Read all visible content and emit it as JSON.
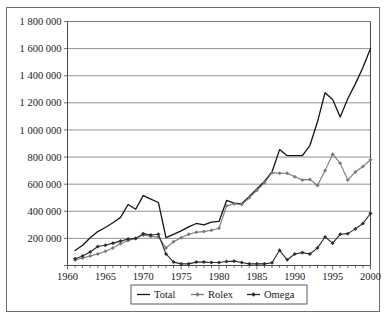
{
  "chart_data": {
    "type": "line",
    "title": "",
    "subtitle": "",
    "xlabel": "",
    "ylabel": "",
    "xlim": [
      1960,
      2000
    ],
    "ylim": [
      0,
      1800000
    ],
    "grid": true,
    "legend_position": "bottom",
    "y_ticks": [
      0,
      200000,
      400000,
      600000,
      800000,
      1000000,
      1200000,
      1400000,
      1600000,
      1800000
    ],
    "y_tick_labels": [
      "",
      "200 000",
      "400 000",
      "600 000",
      "800 000",
      "1 000 000",
      "1 200 000",
      "1 400 000",
      "1 600 000",
      "1 800 000"
    ],
    "x_ticks": [
      1960,
      1965,
      1970,
      1975,
      1980,
      1985,
      1990,
      1995,
      2000
    ],
    "x_tick_labels": [
      "1960",
      "1965",
      "1970",
      "1975",
      "1980",
      "1985",
      "1990",
      "1995",
      "2000"
    ],
    "x_minor_tick_interval": 1,
    "x": [
      1961,
      1962,
      1963,
      1964,
      1965,
      1966,
      1967,
      1968,
      1969,
      1970,
      1971,
      1972,
      1973,
      1974,
      1975,
      1976,
      1977,
      1978,
      1979,
      1980,
      1981,
      1982,
      1983,
      1984,
      1985,
      1986,
      1987,
      1988,
      1989,
      1990,
      1991,
      1992,
      1993,
      1994,
      1995,
      1996,
      1997,
      1998,
      1999,
      2000
    ],
    "series": [
      {
        "name": "Total",
        "color": "#141414",
        "marker": "none",
        "line_width": 1.3,
        "values": [
          110000,
          150000,
          205000,
          250000,
          280000,
          315000,
          355000,
          450000,
          415000,
          515000,
          490000,
          465000,
          205000,
          230000,
          255000,
          285000,
          310000,
          300000,
          320000,
          325000,
          480000,
          460000,
          455000,
          510000,
          565000,
          620000,
          690000,
          855000,
          810000,
          810000,
          810000,
          885000,
          1060000,
          1275000,
          1225000,
          1095000,
          1230000,
          1340000,
          1460000,
          1600000
        ]
      },
      {
        "name": "Rolex",
        "color": "#787878",
        "marker": "diamond",
        "line_width": 1.1,
        "values": [
          40000,
          55000,
          70000,
          85000,
          105000,
          130000,
          160000,
          185000,
          200000,
          225000,
          215000,
          210000,
          130000,
          175000,
          205000,
          230000,
          245000,
          250000,
          260000,
          275000,
          440000,
          455000,
          450000,
          500000,
          555000,
          610000,
          685000,
          680000,
          680000,
          655000,
          630000,
          635000,
          590000,
          700000,
          820000,
          755000,
          630000,
          690000,
          730000,
          780000
        ]
      },
      {
        "name": "Omega",
        "color": "#2b2b2b",
        "marker": "diamond",
        "line_width": 1.1,
        "values": [
          50000,
          70000,
          100000,
          140000,
          150000,
          165000,
          180000,
          195000,
          200000,
          235000,
          225000,
          230000,
          85000,
          25000,
          12000,
          12000,
          25000,
          25000,
          22000,
          22000,
          30000,
          32000,
          22000,
          12000,
          12000,
          12000,
          20000,
          112000,
          42000,
          85000,
          95000,
          85000,
          130000,
          210000,
          165000,
          230000,
          235000,
          270000,
          310000,
          385000
        ]
      }
    ]
  },
  "legend": {
    "items": [
      {
        "label": "Total",
        "color": "#141414",
        "marker": "none"
      },
      {
        "label": "Rolex",
        "color": "#787878",
        "marker": "diamond"
      },
      {
        "label": "Omega",
        "color": "#2b2b2b",
        "marker": "diamond"
      }
    ]
  },
  "axes": {
    "y_axis_name": "y-axis",
    "x_axis_name": "x-axis"
  }
}
